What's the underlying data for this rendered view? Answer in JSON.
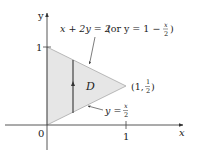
{
  "figure": {
    "axes": {
      "x_label": "x",
      "y_label": "y",
      "origin_label": "0",
      "x_tick_label": "1",
      "y_tick_label": "1"
    },
    "region": {
      "label": "D",
      "fill_color": "#e6e6e6",
      "edge_color": "#9a9a9a",
      "vertices": [
        [
          0,
          0
        ],
        [
          0,
          1
        ],
        [
          1,
          0.5
        ]
      ]
    },
    "upper_boundary": {
      "equation": "x + 2y = 2",
      "alt_prefix": "(or y = 1 − ",
      "alt_frac_num": "x",
      "alt_frac_den": "2",
      "alt_suffix": ")"
    },
    "lower_boundary": {
      "lhs": "y = ",
      "frac_num": "x",
      "frac_den": "2"
    },
    "vertex_label": {
      "prefix": "(1, ",
      "frac_num": "1",
      "frac_den": "2",
      "suffix": ")"
    }
  }
}
